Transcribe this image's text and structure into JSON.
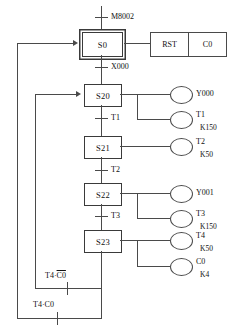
{
  "diagram": {
    "type": "sequential-function-chart",
    "line_color": "#4a4a4a"
  },
  "initial_transition": {
    "label": "M8002"
  },
  "states": [
    {
      "id": "S0",
      "label": "S0",
      "initial": true
    },
    {
      "id": "S20",
      "label": "S20",
      "initial": false
    },
    {
      "id": "S21",
      "label": "S21",
      "initial": false
    },
    {
      "id": "S22",
      "label": "S22",
      "initial": false
    },
    {
      "id": "S23",
      "label": "S23",
      "initial": false
    }
  ],
  "transitions": [
    {
      "label": "X000"
    },
    {
      "label": "T1"
    },
    {
      "label": "T2"
    },
    {
      "label": "T3"
    }
  ],
  "action_block": {
    "instruction": "RST",
    "operand": "C0"
  },
  "coils": [
    {
      "label": "Y000",
      "preset": ""
    },
    {
      "label": "T1",
      "preset": "K150"
    },
    {
      "label": "T2",
      "preset": "K50"
    },
    {
      "label": "Y001",
      "preset": ""
    },
    {
      "label": "T3",
      "preset": "K150"
    },
    {
      "label": "T4",
      "preset": "K50"
    },
    {
      "label": "C0",
      "preset": "K4"
    }
  ],
  "feedback": [
    {
      "id": "inner",
      "prefix": "T4·",
      "overlined": "C0",
      "suffix": "",
      "target": "S20"
    },
    {
      "id": "outer",
      "prefix": "T4·C0",
      "overlined": "",
      "suffix": "",
      "target": "S0"
    }
  ]
}
